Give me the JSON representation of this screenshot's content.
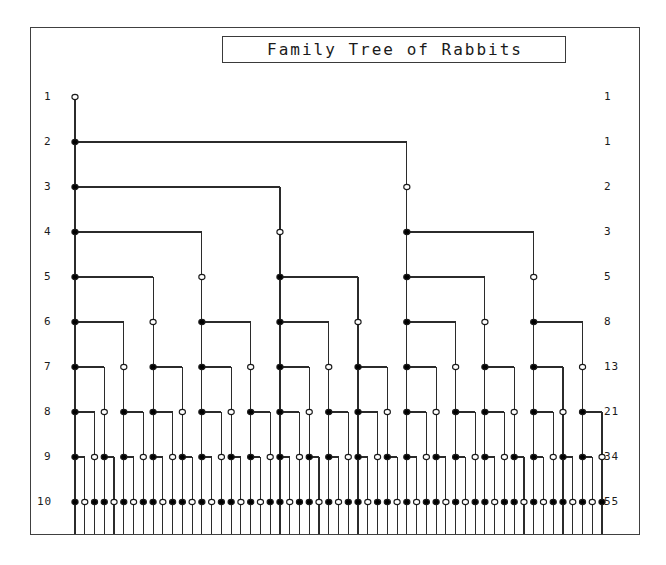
{
  "figure": {
    "title": "Family Tree of Rabbits",
    "background_color": "#ffffff",
    "frame_color": "#404040",
    "line_color": "#2b2b2b",
    "node_fill_mature": "#000000",
    "node_fill_immature": "#ffffff",
    "node_stroke": "#1a1a1a"
  },
  "axes": {
    "left_axis_name": "generation",
    "right_axis_name": "pair-count",
    "left_labels": [
      "1",
      "2",
      "3",
      "4",
      "5",
      "6",
      "7",
      "8",
      "9",
      "10"
    ],
    "right_labels": [
      "1",
      "1",
      "2",
      "3",
      "5",
      "8",
      "13",
      "21",
      "34",
      "55"
    ]
  },
  "chart_data": {
    "type": "diagram",
    "title": "Family Tree of Rabbits",
    "subtitle": "",
    "xlabel": "",
    "ylabel": "",
    "rows": [
      {
        "generation": 1,
        "pairs": 1,
        "mature": 0,
        "immature": 1
      },
      {
        "generation": 2,
        "pairs": 1,
        "mature": 0,
        "immature": 1
      },
      {
        "generation": 3,
        "pairs": 2,
        "mature": 1,
        "immature": 1
      },
      {
        "generation": 4,
        "pairs": 3,
        "mature": 1,
        "immature": 2
      },
      {
        "generation": 5,
        "pairs": 5,
        "mature": 2,
        "immature": 3
      },
      {
        "generation": 6,
        "pairs": 8,
        "mature": 3,
        "immature": 5
      },
      {
        "generation": 7,
        "pairs": 13,
        "mature": 5,
        "immature": 8
      },
      {
        "generation": 8,
        "pairs": 21,
        "mature": 8,
        "immature": 13
      },
      {
        "generation": 9,
        "pairs": 34,
        "mature": 13,
        "immature": 21
      },
      {
        "generation": 10,
        "pairs": 55,
        "mature": 21,
        "immature": 34
      }
    ],
    "categories": [
      "1",
      "2",
      "3",
      "4",
      "5",
      "6",
      "7",
      "8",
      "9",
      "10"
    ],
    "values": [
      1,
      1,
      2,
      3,
      5,
      8,
      13,
      21,
      34,
      55
    ],
    "legend": [
      {
        "symbol": "open-circle",
        "meaning": "immature pair"
      },
      {
        "symbol": "filled-circle",
        "meaning": "mature pair"
      }
    ],
    "grid": false,
    "legend_position": "none"
  },
  "layout": {
    "rows": 10,
    "row_top_y": 97,
    "row_spacing": 45,
    "leaf_left_x": 75,
    "leaf_spacing": 9.76,
    "left_label_x": 44,
    "right_label_x": 604
  }
}
